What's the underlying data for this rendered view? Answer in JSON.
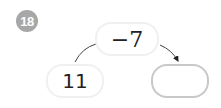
{
  "problem": {
    "number": "18",
    "start_value": "11",
    "operation": "−7",
    "answer": ""
  },
  "colors": {
    "badge": "#a7a7a7",
    "answer_border": "#c8c8c8",
    "box_border": "#f0f0f0",
    "text": "#222222"
  }
}
